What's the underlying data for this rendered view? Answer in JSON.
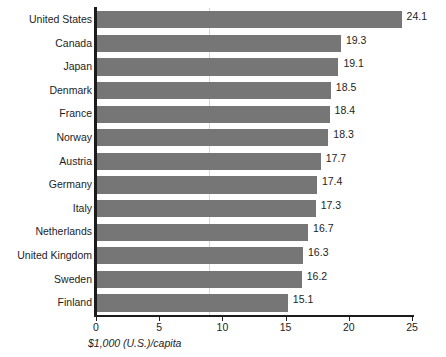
{
  "chart_data": {
    "type": "bar",
    "orientation": "horizontal",
    "title": "",
    "subtitle": "",
    "xlabel": "$1,000 (U.S.)/capita",
    "ylabel": "",
    "xlim": [
      0,
      25
    ],
    "xticks": [
      0,
      5,
      10,
      15,
      20,
      25
    ],
    "xtick_labels": [
      "0",
      "5",
      "10",
      "15",
      "20",
      "25"
    ],
    "grid": false,
    "legend": false,
    "bar_color": "#767676",
    "axis_color": "#1c1c1c",
    "background_color": "#ffffff",
    "categories": [
      "United States",
      "Canada",
      "Japan",
      "Denmark",
      "France",
      "Norway",
      "Austria",
      "Germany",
      "Italy",
      "Netherlands",
      "United Kingdom",
      "Sweden",
      "Finland"
    ],
    "values": [
      24.1,
      19.3,
      19.1,
      18.5,
      18.4,
      18.3,
      17.7,
      17.4,
      17.3,
      16.7,
      16.3,
      16.2,
      15.1
    ],
    "value_labels": [
      "24.1",
      "19.3",
      "19.1",
      "18.5",
      "18.4",
      "18.3",
      "17.7",
      "17.4",
      "17.3",
      "16.7",
      "16.3",
      "16.2",
      "15.1"
    ]
  }
}
